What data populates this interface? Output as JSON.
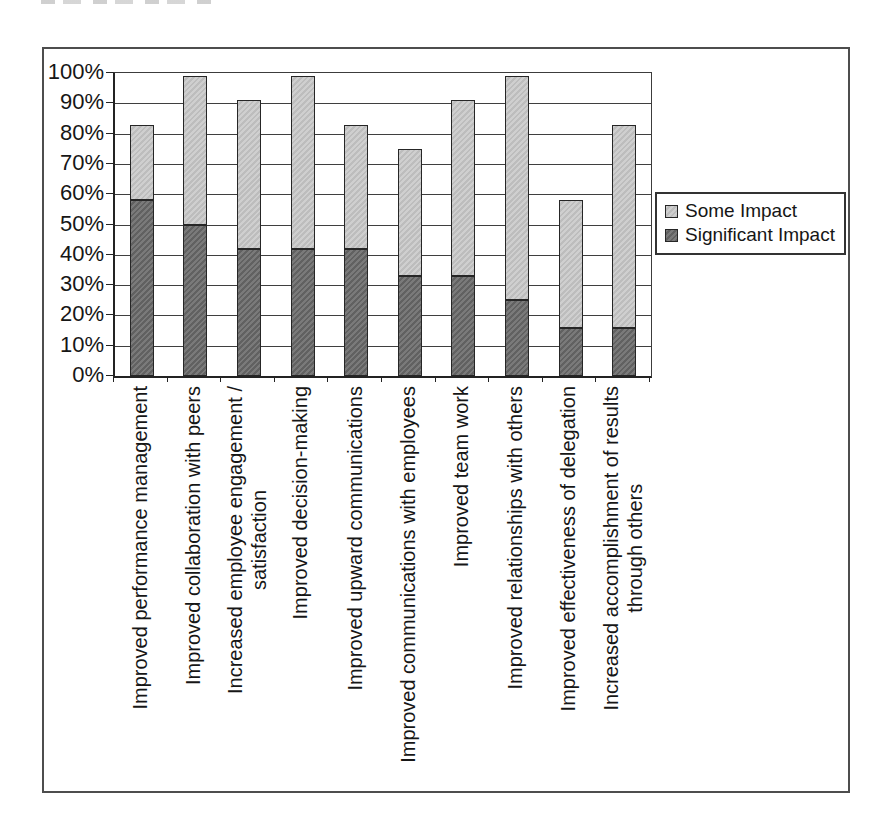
{
  "chart_data": {
    "type": "bar",
    "stacked": true,
    "title": "",
    "xlabel": "",
    "ylabel": "",
    "grid": true,
    "y_axis": {
      "min": 0,
      "max": 100,
      "unit": "%",
      "ticks": [
        "0%",
        "10%",
        "20%",
        "30%",
        "40%",
        "50%",
        "60%",
        "70%",
        "80%",
        "90%",
        "100%"
      ]
    },
    "categories": [
      {
        "lines": [
          "Improved performance management"
        ]
      },
      {
        "lines": [
          "Improved collaboration with peers"
        ]
      },
      {
        "lines": [
          "Increased employee engagement /",
          "satisfaction"
        ]
      },
      {
        "lines": [
          "Improved decision-making"
        ]
      },
      {
        "lines": [
          "Improved upward communications"
        ]
      },
      {
        "lines": [
          "Improved communications with employees"
        ]
      },
      {
        "lines": [
          "Improved team work"
        ]
      },
      {
        "lines": [
          "Improved relationships with others"
        ]
      },
      {
        "lines": [
          "Improved effectiveness of delegation"
        ]
      },
      {
        "lines": [
          "Increased accomplishment of results",
          "through others"
        ]
      }
    ],
    "series": [
      {
        "name": "Significant Impact",
        "color": "#696969",
        "values": [
          58,
          50,
          42,
          42,
          42,
          33,
          33,
          25,
          16,
          16
        ]
      },
      {
        "name": "Some Impact",
        "color": "#c6c6c6",
        "values": [
          25,
          49,
          49,
          57,
          41,
          42,
          58,
          74,
          42,
          67
        ]
      }
    ],
    "stack_totals": [
      83,
      99,
      91,
      99,
      83,
      75,
      91,
      99,
      58,
      83
    ],
    "legend": {
      "position": "right",
      "entries": [
        {
          "label": "Some Impact",
          "swatch": "#c6c6c6"
        },
        {
          "label": "Significant Impact",
          "swatch": "#696969"
        }
      ]
    }
  }
}
